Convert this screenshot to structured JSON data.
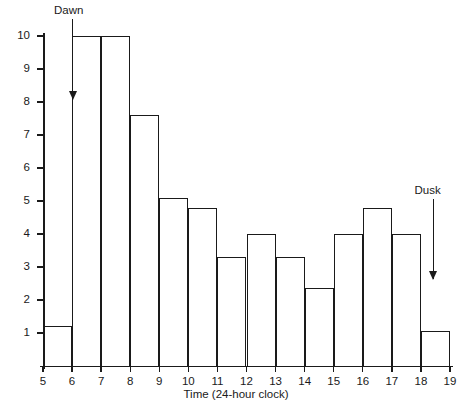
{
  "chart_data": {
    "type": "bar",
    "title": "",
    "subtitle": "",
    "xlabel": "Time (24-hour clock)",
    "ylabel": "",
    "grid": false,
    "legend": null,
    "xlim": [
      5,
      19
    ],
    "ylim": [
      0,
      10
    ],
    "x_ticks": [
      "5",
      "6",
      "7",
      "8",
      "9",
      "10",
      "11",
      "12",
      "13",
      "14",
      "15",
      "16",
      "17",
      "18",
      "19"
    ],
    "y_ticks": [
      "1",
      "2",
      "3",
      "4",
      "5",
      "6",
      "7",
      "8",
      "9",
      "10"
    ],
    "bin_edges": [
      5,
      6,
      7,
      8,
      9,
      10,
      11,
      12,
      13,
      14,
      15,
      16,
      17,
      18,
      19
    ],
    "categories": [
      "5-6",
      "6-7",
      "7-8",
      "8-9",
      "9-10",
      "10-11",
      "11-12",
      "12-13",
      "13-14",
      "14-15",
      "15-16",
      "16-17",
      "17-18",
      "18-19"
    ],
    "values": [
      1.2,
      10,
      10,
      7.6,
      5.1,
      4.8,
      3.3,
      4.0,
      3.3,
      2.35,
      4.0,
      4.8,
      4.0,
      1.05
    ],
    "annotations": [
      {
        "label": "Dawn",
        "x": 6.0,
        "y_from": 10.0,
        "y_to": 8.1
      },
      {
        "label": "Dusk",
        "x": 18.4,
        "y_from": 4.55,
        "y_to": 2.65
      }
    ]
  }
}
